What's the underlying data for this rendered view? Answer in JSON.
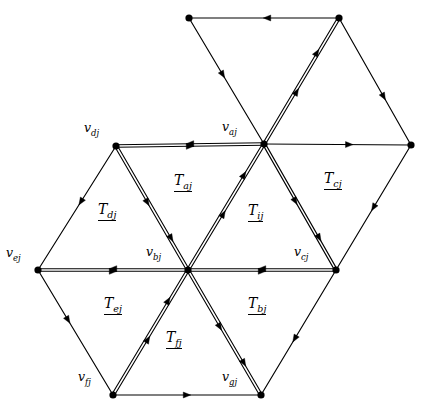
{
  "figure": {
    "background": "#ffffff",
    "stroke": "#000000",
    "width": 430,
    "height": 414
  },
  "vertices": [
    {
      "id": "v_top_left",
      "label": "",
      "sub": "",
      "x": 189,
      "y": 18,
      "labeled": false
    },
    {
      "id": "v_top_right",
      "label": "",
      "sub": "",
      "x": 339,
      "y": 18,
      "labeled": false
    },
    {
      "id": "v_dj",
      "label": "v",
      "sub": "dj",
      "x": 116,
      "y": 146,
      "labeled": true,
      "label_x": 84,
      "label_y": 120
    },
    {
      "id": "v_aj",
      "label": "v",
      "sub": "aj",
      "x": 264,
      "y": 144,
      "labeled": true,
      "label_x": 222,
      "label_y": 119
    },
    {
      "id": "v_right",
      "label": "",
      "sub": "",
      "x": 411,
      "y": 145,
      "labeled": false
    },
    {
      "id": "v_ej",
      "label": "v",
      "sub": "ej",
      "x": 38,
      "y": 270,
      "labeled": true,
      "label_x": 6,
      "label_y": 245
    },
    {
      "id": "v_bj",
      "label": "v",
      "sub": "bj",
      "x": 188,
      "y": 270,
      "labeled": true,
      "label_x": 146,
      "label_y": 244
    },
    {
      "id": "v_cj",
      "label": "v",
      "sub": "cj",
      "x": 336,
      "y": 270,
      "labeled": true,
      "label_x": 294,
      "label_y": 244
    },
    {
      "id": "v_fj",
      "label": "v",
      "sub": "fj",
      "x": 113,
      "y": 395,
      "labeled": true,
      "label_x": 78,
      "label_y": 369
    },
    {
      "id": "v_gj",
      "label": "v",
      "sub": "gj",
      "x": 261,
      "y": 395,
      "labeled": true,
      "label_x": 222,
      "label_y": 369
    }
  ],
  "triangle_labels": [
    {
      "id": "T_aj",
      "label": "T",
      "sub": "aj",
      "x": 174,
      "y": 173
    },
    {
      "id": "T_cj",
      "label": "T",
      "sub": "cj",
      "x": 324,
      "y": 171
    },
    {
      "id": "T_dj",
      "label": "T",
      "sub": "dj",
      "x": 98,
      "y": 202
    },
    {
      "id": "T_ij",
      "label": "T",
      "sub": "ij",
      "x": 248,
      "y": 203
    },
    {
      "id": "T_ej",
      "label": "T",
      "sub": "ej",
      "x": 104,
      "y": 296
    },
    {
      "id": "T_bj",
      "label": "T",
      "sub": "bj",
      "x": 248,
      "y": 296
    },
    {
      "id": "T_fj",
      "label": "T",
      "sub": "fj",
      "x": 166,
      "y": 330
    }
  ],
  "edges": [
    {
      "id": "e-topleft-topright",
      "from": "v_top_left",
      "to": "v_top_right",
      "double": false,
      "arrow_dir": "backward",
      "arrow_t": 0.52
    },
    {
      "id": "e-topleft-vaj",
      "from": "v_top_left",
      "to": "v_aj",
      "double": false,
      "arrow_dir": "forward",
      "arrow_t": 0.45
    },
    {
      "id": "e-vaj-topright",
      "from": "v_aj",
      "to": "v_top_right",
      "double": true,
      "arrow_dir": "forward",
      "arrow_t": 0.42
    },
    {
      "id": "e-topright-vright",
      "from": "v_top_right",
      "to": "v_right",
      "double": false,
      "arrow_dir": "forward",
      "arrow_t": 0.62
    },
    {
      "id": "e-vdj-vaj",
      "from": "v_dj",
      "to": "v_aj",
      "double": true,
      "arrow_dir": "split",
      "arrow_t": 0.5
    },
    {
      "id": "e-vaj-vright",
      "from": "v_aj",
      "to": "v_right",
      "double": false,
      "arrow_dir": "forward",
      "arrow_t": 0.58
    },
    {
      "id": "e-vdj-vbj",
      "from": "v_dj",
      "to": "v_bj",
      "double": true,
      "arrow_dir": "forward",
      "arrow_t": 0.45
    },
    {
      "id": "e-vdj-vej",
      "from": "v_dj",
      "to": "v_ej",
      "double": false,
      "arrow_dir": "forward",
      "arrow_t": 0.45
    },
    {
      "id": "e-vbj-vaj",
      "from": "v_bj",
      "to": "v_aj",
      "double": true,
      "arrow_dir": "forward",
      "arrow_t": 0.45
    },
    {
      "id": "e-vaj-vcj",
      "from": "v_aj",
      "to": "v_cj",
      "double": true,
      "arrow_dir": "forward",
      "arrow_t": 0.45
    },
    {
      "id": "e-vcj-vright",
      "from": "v_cj",
      "to": "v_right",
      "double": false,
      "arrow_dir": "backward",
      "arrow_t": 0.5
    },
    {
      "id": "e-vej-vbj",
      "from": "v_ej",
      "to": "v_bj",
      "double": true,
      "arrow_dir": "split",
      "arrow_t": 0.5
    },
    {
      "id": "e-vbj-vcj",
      "from": "v_bj",
      "to": "v_cj",
      "double": true,
      "arrow_dir": "split",
      "arrow_t": 0.5
    },
    {
      "id": "e-vej-vfj",
      "from": "v_ej",
      "to": "v_fj",
      "double": false,
      "arrow_dir": "forward",
      "arrow_t": 0.4
    },
    {
      "id": "e-vfj-vbj",
      "from": "v_fj",
      "to": "v_bj",
      "double": true,
      "arrow_dir": "forward",
      "arrow_t": 0.45
    },
    {
      "id": "e-vbj-vgj",
      "from": "v_bj",
      "to": "v_gj",
      "double": true,
      "arrow_dir": "forward",
      "arrow_t": 0.45
    },
    {
      "id": "e-vgj-vcj",
      "from": "v_gj",
      "to": "v_cj",
      "double": false,
      "arrow_dir": "backward",
      "arrow_t": 0.45
    },
    {
      "id": "e-vfj-vgj",
      "from": "v_fj",
      "to": "v_gj",
      "double": false,
      "arrow_dir": "forward",
      "arrow_t": 0.5
    }
  ]
}
